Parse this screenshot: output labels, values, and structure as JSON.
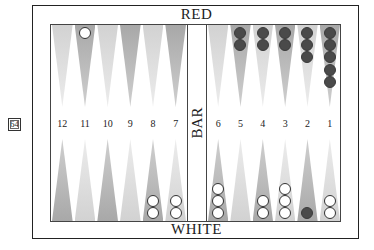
{
  "board": {
    "top_label": "RED",
    "bottom_label": "WHITE",
    "bar_label": "BAR",
    "cube_value": "64",
    "colors": {
      "light_point": "#e0e0e0",
      "dark_point": "#b8b8b8",
      "red_checker": "#4a4a4a",
      "white_checker": "#ffffff"
    },
    "top_points": [
      {
        "side": "left",
        "index": 0,
        "shade": "light",
        "checkers": 0,
        "color": "white"
      },
      {
        "side": "left",
        "index": 1,
        "shade": "dark",
        "checkers": 1,
        "color": "white"
      },
      {
        "side": "left",
        "index": 2,
        "shade": "light",
        "checkers": 0,
        "color": "white"
      },
      {
        "side": "left",
        "index": 3,
        "shade": "dark",
        "checkers": 0,
        "color": "white"
      },
      {
        "side": "left",
        "index": 4,
        "shade": "light",
        "checkers": 0,
        "color": "white"
      },
      {
        "side": "left",
        "index": 5,
        "shade": "dark",
        "checkers": 0,
        "color": "white"
      },
      {
        "side": "right",
        "index": 0,
        "shade": "light",
        "checkers": 0,
        "color": "red"
      },
      {
        "side": "right",
        "index": 1,
        "shade": "dark",
        "checkers": 2,
        "color": "red"
      },
      {
        "side": "right",
        "index": 2,
        "shade": "light",
        "checkers": 2,
        "color": "red"
      },
      {
        "side": "right",
        "index": 3,
        "shade": "dark",
        "checkers": 2,
        "color": "red"
      },
      {
        "side": "right",
        "index": 4,
        "shade": "light",
        "checkers": 3,
        "color": "red"
      },
      {
        "side": "right",
        "index": 5,
        "shade": "dark",
        "checkers": 5,
        "color": "red"
      }
    ],
    "bottom_points": [
      {
        "side": "left",
        "index": 0,
        "label": "12",
        "shade": "dark",
        "checkers": 0,
        "color": "white"
      },
      {
        "side": "left",
        "index": 1,
        "label": "11",
        "shade": "light",
        "checkers": 0,
        "color": "white"
      },
      {
        "side": "left",
        "index": 2,
        "label": "10",
        "shade": "dark",
        "checkers": 0,
        "color": "white"
      },
      {
        "side": "left",
        "index": 3,
        "label": "9",
        "shade": "light",
        "checkers": 0,
        "color": "white"
      },
      {
        "side": "left",
        "index": 4,
        "label": "8",
        "shade": "dark",
        "checkers": 2,
        "color": "white"
      },
      {
        "side": "left",
        "index": 5,
        "label": "7",
        "shade": "light",
        "checkers": 2,
        "color": "white"
      },
      {
        "side": "right",
        "index": 0,
        "label": "6",
        "shade": "dark",
        "checkers": 3,
        "color": "white"
      },
      {
        "side": "right",
        "index": 1,
        "label": "5",
        "shade": "light",
        "checkers": 0,
        "color": "white"
      },
      {
        "side": "right",
        "index": 2,
        "label": "4",
        "shade": "dark",
        "checkers": 2,
        "color": "white"
      },
      {
        "side": "right",
        "index": 3,
        "label": "3",
        "shade": "light",
        "checkers": 3,
        "color": "white"
      },
      {
        "side": "right",
        "index": 4,
        "label": "2",
        "shade": "dark",
        "checkers": 1,
        "color": "red"
      },
      {
        "side": "right",
        "index": 5,
        "label": "1",
        "shade": "light",
        "checkers": 2,
        "color": "white"
      }
    ]
  }
}
